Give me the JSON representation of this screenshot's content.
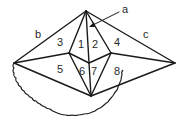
{
  "diagram": {
    "vertices": {
      "apex": [
        86,
        11
      ],
      "left": [
        14,
        63
      ],
      "right": [
        175,
        63
      ],
      "inner_left": [
        69,
        53
      ],
      "inner_right": [
        111,
        53
      ],
      "center": [
        89,
        63
      ],
      "bottom": [
        91,
        96
      ]
    },
    "labels": {
      "a": {
        "text": "a",
        "x": 122,
        "y": 13
      },
      "b": {
        "text": "b",
        "x": 35,
        "y": 38
      },
      "c": {
        "text": "c",
        "x": 143,
        "y": 38
      },
      "r1": {
        "text": "1",
        "x": 78,
        "y": 48
      },
      "r2": {
        "text": "2",
        "x": 92,
        "y": 48
      },
      "r3": {
        "text": "3",
        "x": 57,
        "y": 46
      },
      "r4": {
        "text": "4",
        "x": 114,
        "y": 46
      },
      "r5": {
        "text": "5",
        "x": 57,
        "y": 73
      },
      "r6": {
        "text": "6",
        "x": 79,
        "y": 75
      },
      "r7": {
        "text": "7",
        "x": 91,
        "y": 75
      },
      "r8": {
        "text": "8",
        "x": 114,
        "y": 75
      }
    },
    "stroke_color": "#1a1a1a"
  }
}
